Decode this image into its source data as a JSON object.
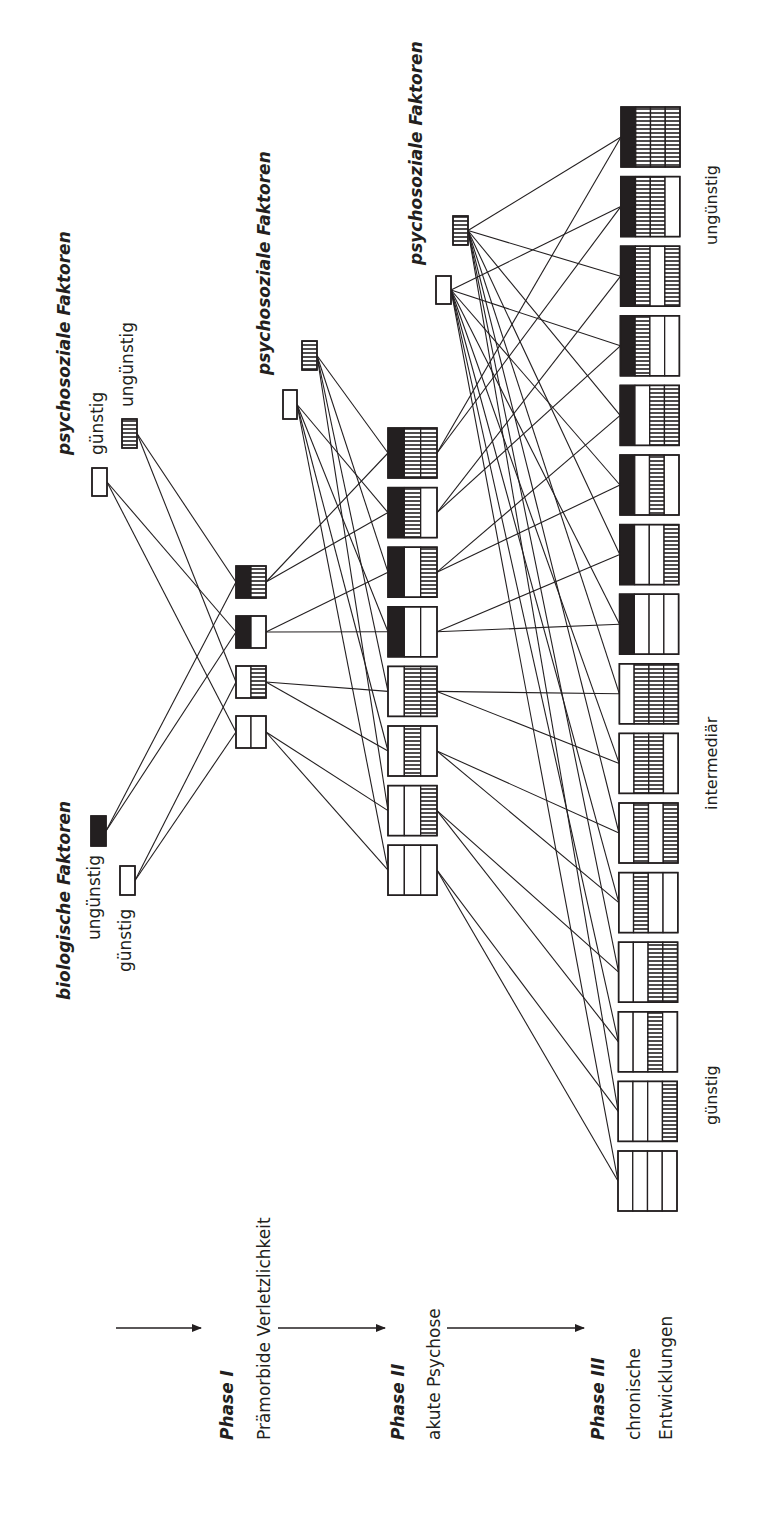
{
  "diagram": {
    "ink": "#231f20",
    "background": "#ffffff",
    "rotation_note": "diagram printed rotated 90deg counter-clockwise",
    "phases": [
      {
        "id": "phase1",
        "title": "Phase I",
        "subtitle_lines": [
          "Prämorbide Verletzlichkeit"
        ]
      },
      {
        "id": "phase2",
        "title": "Phase II",
        "subtitle_lines": [
          "akute Psychose"
        ]
      },
      {
        "id": "phase3",
        "title": "Phase III",
        "subtitle_lines": [
          "chronische",
          "Entwicklungen"
        ]
      }
    ],
    "factor_groups": [
      {
        "id": "bio",
        "title": "biologische Faktoren",
        "favorable": "günstig",
        "unfavorable": "ungünstig"
      },
      {
        "id": "psy1",
        "title": "psychosoziale Faktoren",
        "favorable": "günstig",
        "unfavorable": "ungünstig"
      },
      {
        "id": "psy2",
        "title": "psychosoziale Faktoren"
      },
      {
        "id": "psy3",
        "title": "psychosoziale Faktoren"
      }
    ],
    "outcome_labels": {
      "favorable": "günstig",
      "intermediate": "intermediär",
      "unfavorable": "ungünstig"
    },
    "legend_patterns": {
      "empty": "günstig (weiß)",
      "black": "biologisch ungünstig (schwarz)",
      "hatch": "psychosozial ungünstig (schraffiert)"
    },
    "phase1_boxes": [
      [
        "black",
        "hatch"
      ],
      [
        "black",
        "empty"
      ],
      [
        "empty",
        "hatch"
      ],
      [
        "empty",
        "empty"
      ]
    ],
    "phase2_boxes": [
      [
        "black",
        "hatch",
        "hatch"
      ],
      [
        "black",
        "hatch",
        "empty"
      ],
      [
        "black",
        "empty",
        "hatch"
      ],
      [
        "black",
        "empty",
        "empty"
      ],
      [
        "empty",
        "hatch",
        "hatch"
      ],
      [
        "empty",
        "hatch",
        "empty"
      ],
      [
        "empty",
        "empty",
        "hatch"
      ],
      [
        "empty",
        "empty",
        "empty"
      ]
    ],
    "phase3_boxes": [
      [
        "black",
        "hatch",
        "hatch",
        "hatch"
      ],
      [
        "black",
        "hatch",
        "hatch",
        "empty"
      ],
      [
        "black",
        "hatch",
        "empty",
        "hatch"
      ],
      [
        "black",
        "hatch",
        "empty",
        "empty"
      ],
      [
        "black",
        "empty",
        "hatch",
        "hatch"
      ],
      [
        "black",
        "empty",
        "hatch",
        "empty"
      ],
      [
        "black",
        "empty",
        "empty",
        "hatch"
      ],
      [
        "black",
        "empty",
        "empty",
        "empty"
      ],
      [
        "empty",
        "hatch",
        "hatch",
        "hatch"
      ],
      [
        "empty",
        "hatch",
        "hatch",
        "empty"
      ],
      [
        "empty",
        "hatch",
        "empty",
        "hatch"
      ],
      [
        "empty",
        "hatch",
        "empty",
        "empty"
      ],
      [
        "empty",
        "empty",
        "hatch",
        "hatch"
      ],
      [
        "empty",
        "empty",
        "hatch",
        "empty"
      ],
      [
        "empty",
        "empty",
        "empty",
        "hatch"
      ],
      [
        "empty",
        "empty",
        "empty",
        "empty"
      ]
    ],
    "phase_arrows": 3
  }
}
